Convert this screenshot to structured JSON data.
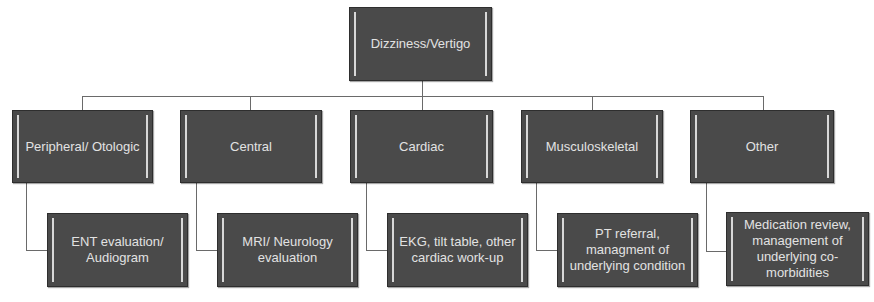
{
  "diagram": {
    "type": "tree",
    "root": {
      "label": "Dizziness/Vertigo"
    },
    "categories": [
      {
        "label": "Peripheral/ Otologic",
        "action": "ENT evaluation/\nAudiogram"
      },
      {
        "label": "Central",
        "action": "MRI/ Neurology\nevaluation"
      },
      {
        "label": "Cardiac",
        "action": "EKG, tilt table, other\ncardiac work-up"
      },
      {
        "label": "Musculoskeletal",
        "action": "PT referral,\nmanagment of\nunderlying condition"
      },
      {
        "label": "Other",
        "action": "Medication review,\nmanagement of\nunderlying co-\nmorbidities"
      }
    ],
    "colors": {
      "node_fill": "#4a4a4a",
      "node_text": "#e2e2e2",
      "connector": "#6a6a6a",
      "background": "#ffffff"
    }
  }
}
